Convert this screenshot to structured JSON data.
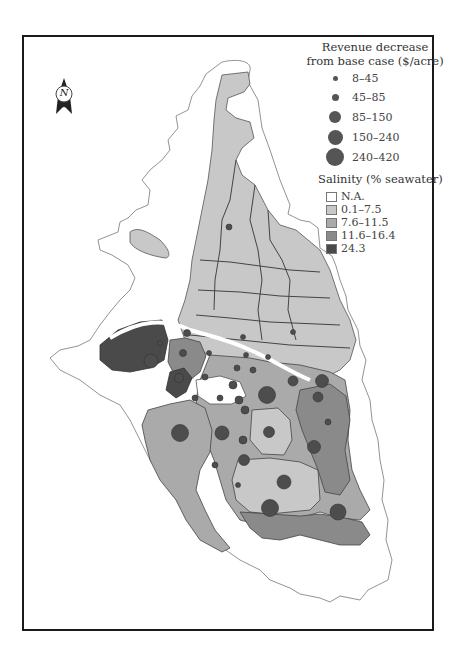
{
  "map": {
    "north_arrow": {
      "label": "N"
    },
    "revenue_legend": {
      "title_line1": "Revenue decrease",
      "title_line2": "from base case ($/acre)",
      "classes": [
        {
          "label": "8–45",
          "radius": 2.5
        },
        {
          "label": "45–85",
          "radius": 4
        },
        {
          "label": "85–150",
          "radius": 6.5
        },
        {
          "label": "150–240",
          "radius": 8
        },
        {
          "label": "240–420",
          "radius": 9.5
        }
      ]
    },
    "salinity_legend": {
      "title": "Salinity (% seawater)",
      "classes": [
        {
          "label": "N.A.",
          "color": "#ffffff"
        },
        {
          "label": "0.1–7.5",
          "color": "#c8c8c8"
        },
        {
          "label": "7.6–11.5",
          "color": "#aaaaaa"
        },
        {
          "label": "11.6–16.4",
          "color": "#8a8a8a"
        },
        {
          "label": "24.3",
          "color": "#4a4a4a"
        }
      ]
    },
    "colors": {
      "frame": "#1a1a1a",
      "outline": "#555555",
      "dot": "#4d4d4d"
    }
  }
}
